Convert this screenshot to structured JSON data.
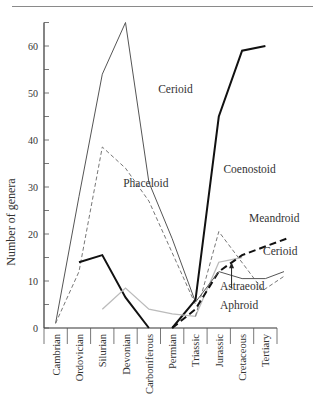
{
  "chart_data": {
    "type": "line",
    "title": "",
    "xlabel": "",
    "ylabel": "Number of genera",
    "ylim": [
      0,
      65
    ],
    "yticks": [
      0,
      10,
      20,
      30,
      40,
      50,
      60
    ],
    "grid": false,
    "legend": "inline labels",
    "categories": [
      "Cambrian",
      "Ordovician",
      "Silurian",
      "Devonian",
      "Carboniferous",
      "Permian",
      "Triassic",
      "Jurassic",
      "Cretaceous",
      "Tertiary"
    ],
    "series": [
      {
        "name": "Cerioid (Paleozoic)",
        "style": "thin-solid",
        "color": "#555555",
        "points": [
          [
            0,
            1
          ],
          [
            1,
            28
          ],
          [
            2,
            54
          ],
          [
            3,
            65
          ],
          [
            4,
            31
          ],
          [
            5,
            19
          ],
          [
            6,
            5.5
          ]
        ]
      },
      {
        "name": "Phaceloid (Paleozoic)",
        "style": "thin-dashed",
        "color": "#777777",
        "points": [
          [
            0,
            1
          ],
          [
            1,
            12
          ],
          [
            2,
            38.5
          ],
          [
            3,
            34
          ],
          [
            4,
            27
          ],
          [
            5,
            16
          ],
          [
            6,
            5
          ]
        ]
      },
      {
        "name": "Coenostoid",
        "style": "thick-solid",
        "color": "#111111",
        "points": [
          [
            1,
            14
          ],
          [
            2,
            15.5
          ],
          [
            3,
            6.5
          ],
          [
            4,
            0
          ]
        ]
      },
      {
        "name": "Coenostoid (Mesozoic-Tertiary)",
        "style": "thick-solid",
        "color": "#111111",
        "points": [
          [
            5,
            0
          ],
          [
            6,
            6
          ],
          [
            7,
            45
          ],
          [
            8,
            59
          ],
          [
            9,
            60
          ]
        ]
      },
      {
        "name": "Astraeoid/Aphroid",
        "style": "light-solid",
        "color": "#bbbbbb",
        "points": [
          [
            2,
            4
          ],
          [
            3,
            8.5
          ],
          [
            4,
            4
          ],
          [
            5,
            3
          ],
          [
            6,
            2.5
          ],
          [
            7,
            14
          ],
          [
            8,
            15
          ]
        ]
      },
      {
        "name": "Phaceloid (Mesozoic-Tertiary)",
        "style": "thin-dashed",
        "color": "#777777",
        "points": [
          [
            6,
            2.5
          ],
          [
            7,
            20.5
          ],
          [
            8.9,
            8
          ],
          [
            9.8,
            11
          ]
        ]
      },
      {
        "name": "Meandroid",
        "style": "thick-dashed",
        "color": "#111111",
        "points": [
          [
            5,
            0
          ],
          [
            6,
            4
          ],
          [
            7,
            12
          ],
          [
            8,
            15.5
          ],
          [
            9.9,
            19
          ]
        ]
      },
      {
        "name": "Cerioid (Mesozoic-Tertiary)",
        "style": "thin-solid",
        "color": "#555555",
        "points": [
          [
            6,
            5.5
          ],
          [
            7,
            12
          ],
          [
            8,
            10.5
          ],
          [
            9,
            10.5
          ],
          [
            9.8,
            12
          ]
        ]
      }
    ],
    "annotations": [
      {
        "text": "Cerioid",
        "x": 4.4,
        "y": 50
      },
      {
        "text": "Phaceloid",
        "x": 2.9,
        "y": 30
      },
      {
        "text": "Coenostoid",
        "x": 7.2,
        "y": 33
      },
      {
        "text": "Meandroid",
        "x": 8.3,
        "y": 22.5
      },
      {
        "text": "Cerioid",
        "x": 8.9,
        "y": 15.5
      },
      {
        "text": "Astraeoid",
        "x": 7.05,
        "y": 8
      },
      {
        "text": "Aphroid",
        "x": 7.05,
        "y": 4
      },
      {
        "text": "arrow",
        "x": 7.55,
        "y": 11.5,
        "to_y": 14
      }
    ]
  },
  "labels": {
    "ylabel": "Number of genera"
  }
}
